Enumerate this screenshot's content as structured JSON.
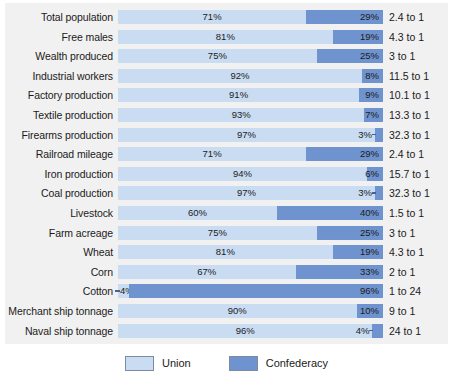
{
  "chart_data": {
    "type": "bar",
    "title": "",
    "subtitle": "",
    "xlabel": "",
    "ylabel": "",
    "xlim": [
      0,
      100
    ],
    "grid": false,
    "stacked": true,
    "orientation": "horizontal",
    "legend_position": "bottom-center",
    "colors": {
      "union": "#c9dcf2",
      "confederacy": "#6f93ce",
      "panel_background": "#f1f1f1",
      "text": "#1b1b1b"
    },
    "legend": [
      {
        "label": "Union",
        "color": "#c9dcf2",
        "swatch": "union-swatch"
      },
      {
        "label": "Confederacy",
        "color": "#6f93ce",
        "swatch": "confederacy-swatch"
      }
    ],
    "series": [
      {
        "name": "Union",
        "values": [
          71,
          81,
          75,
          92,
          91,
          93,
          97,
          71,
          94,
          97,
          60,
          75,
          81,
          67,
          4,
          90,
          96
        ]
      },
      {
        "name": "Confederacy",
        "values": [
          29,
          19,
          25,
          8,
          9,
          7,
          3,
          29,
          6,
          3,
          40,
          25,
          19,
          33,
          96,
          10,
          4
        ]
      }
    ],
    "categories": [
      "Total population",
      "Free males",
      "Wealth produced",
      "Industrial workers",
      "Factory production",
      "Textile production",
      "Firearms production",
      "Railroad mileage",
      "Iron production",
      "Coal production",
      "Livestock",
      "Farm acreage",
      "Wheat",
      "Corn",
      "Cotton",
      "Merchant ship tonnage",
      "Naval ship tonnage"
    ],
    "ratios": [
      "2.4 to 1",
      "4.3 to 1",
      "3 to 1",
      "11.5 to 1",
      "10.1 to 1",
      "13.3 to 1",
      "32.3 to 1",
      "2.4 to 1",
      "15.7 to 1",
      "32.3 to 1",
      "1.5 to 1",
      "3 to 1",
      "4.3 to 1",
      "2 to 1",
      "1 to 24",
      "9 to 1",
      "24 to 1"
    ],
    "rows": [
      {
        "label": "Total population",
        "union": 71,
        "confederacy": 29,
        "union_text": "71%",
        "confederacy_text": "29%",
        "ratio": "2.4 to 1",
        "conf_label_outside": false,
        "union_label_outside": false
      },
      {
        "label": "Free males",
        "union": 81,
        "confederacy": 19,
        "union_text": "81%",
        "confederacy_text": "19%",
        "ratio": "4.3 to 1",
        "conf_label_outside": false,
        "union_label_outside": false
      },
      {
        "label": "Wealth produced",
        "union": 75,
        "confederacy": 25,
        "union_text": "75%",
        "confederacy_text": "25%",
        "ratio": "3 to 1",
        "conf_label_outside": false,
        "union_label_outside": false
      },
      {
        "label": "Industrial workers",
        "union": 92,
        "confederacy": 8,
        "union_text": "92%",
        "confederacy_text": "8%",
        "ratio": "11.5 to 1",
        "conf_label_outside": false,
        "union_label_outside": false
      },
      {
        "label": "Factory production",
        "union": 91,
        "confederacy": 9,
        "union_text": "91%",
        "confederacy_text": "9%",
        "ratio": "10.1 to 1",
        "conf_label_outside": false,
        "union_label_outside": false
      },
      {
        "label": "Textile production",
        "union": 93,
        "confederacy": 7,
        "union_text": "93%",
        "confederacy_text": "7%",
        "ratio": "13.3 to 1",
        "conf_label_outside": false,
        "union_label_outside": false
      },
      {
        "label": "Firearms production",
        "union": 97,
        "confederacy": 3,
        "union_text": "97%",
        "confederacy_text": "3%",
        "ratio": "32.3 to 1",
        "conf_label_outside": true,
        "union_label_outside": false
      },
      {
        "label": "Railroad mileage",
        "union": 71,
        "confederacy": 29,
        "union_text": "71%",
        "confederacy_text": "29%",
        "ratio": "2.4 to 1",
        "conf_label_outside": false,
        "union_label_outside": false
      },
      {
        "label": "Iron production",
        "union": 94,
        "confederacy": 6,
        "union_text": "94%",
        "confederacy_text": "6%",
        "ratio": "15.7 to 1",
        "conf_label_outside": false,
        "union_label_outside": false
      },
      {
        "label": "Coal production",
        "union": 97,
        "confederacy": 3,
        "union_text": "97%",
        "confederacy_text": "3%",
        "ratio": "32.3 to 1",
        "conf_label_outside": true,
        "union_label_outside": false
      },
      {
        "label": "Livestock",
        "union": 60,
        "confederacy": 40,
        "union_text": "60%",
        "confederacy_text": "40%",
        "ratio": "1.5 to 1",
        "conf_label_outside": false,
        "union_label_outside": false
      },
      {
        "label": "Farm acreage",
        "union": 75,
        "confederacy": 25,
        "union_text": "75%",
        "confederacy_text": "25%",
        "ratio": "3 to 1",
        "conf_label_outside": false,
        "union_label_outside": false
      },
      {
        "label": "Wheat",
        "union": 81,
        "confederacy": 19,
        "union_text": "81%",
        "confederacy_text": "19%",
        "ratio": "4.3 to 1",
        "conf_label_outside": false,
        "union_label_outside": false
      },
      {
        "label": "Corn",
        "union": 67,
        "confederacy": 33,
        "union_text": "67%",
        "confederacy_text": "33%",
        "ratio": "2 to 1",
        "conf_label_outside": false,
        "union_label_outside": false
      },
      {
        "label": "Cotton",
        "union": 4,
        "confederacy": 96,
        "union_text": "4%",
        "confederacy_text": "96%",
        "ratio": "1 to 24",
        "conf_label_outside": false,
        "union_label_outside": true
      },
      {
        "label": "Merchant ship tonnage",
        "union": 90,
        "confederacy": 10,
        "union_text": "90%",
        "confederacy_text": "10%",
        "ratio": "9 to 1",
        "conf_label_outside": false,
        "union_label_outside": false
      },
      {
        "label": "Naval ship tonnage",
        "union": 96,
        "confederacy": 4,
        "union_text": "96%",
        "confederacy_text": "4%",
        "ratio": "24 to 1",
        "conf_label_outside": true,
        "union_label_outside": false
      }
    ]
  }
}
